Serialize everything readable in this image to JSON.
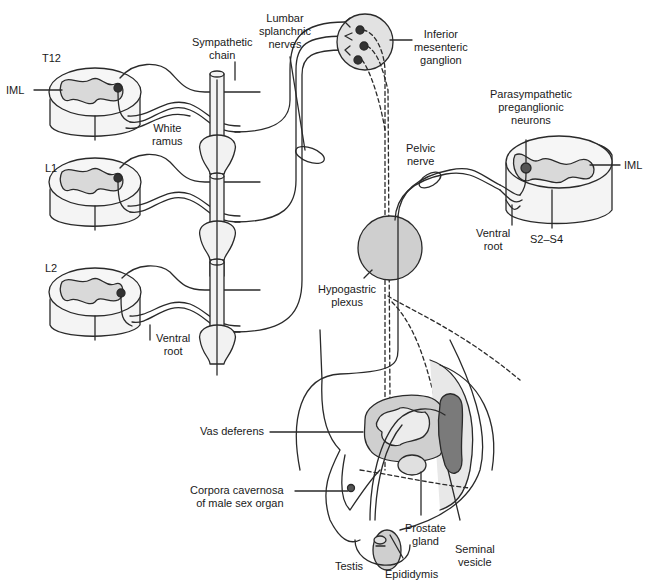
{
  "diagram": {
    "colors": {
      "line": "#2a2a2a",
      "gray_matter": "#d9d9d9",
      "ganglion_fill": "#e2e2e2",
      "plexus_fill": "#cfcfcf",
      "neuron": "#333333",
      "para_neuron": "#555555",
      "seminal_vesicle": "#7a7a7a",
      "organ_fill": "#dcdcdc",
      "background": "#ffffff"
    },
    "labels": {
      "t12": "T12",
      "l1": "L1",
      "l2": "L2",
      "iml_left": "IML",
      "iml_right": "IML",
      "sympathetic_chain": "Sympathetic\nchain",
      "lumbar_splanchnic": "Lumbar\nsplanchnic\nnerves",
      "inferior_mesenteric": "Inferior\nmesenteric\nganglion",
      "white_ramus": "White\nramus",
      "ventral_root_left": "Ventral\nroot",
      "parasympathetic": "Parasympathetic\npreganglionic\nneurons",
      "pelvic_nerve": "Pelvic\nnerve",
      "ventral_root_right": "Ventral\nroot",
      "s2_s4": "S2–S4",
      "hypogastric": "Hypogastric\nplexus",
      "vas_deferens": "Vas deferens",
      "corpora": "Corpora cavernosa\nof male sex organ",
      "prostate": "Prostate\ngland",
      "seminal": "Seminal\nvesicle",
      "testis": "Testis",
      "epididymis": "Epididymis"
    },
    "legend": {
      "solid_line": "preganglionic fiber",
      "dashed_line": "postganglionic fiber"
    }
  }
}
